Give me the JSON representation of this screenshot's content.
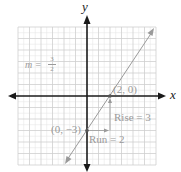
{
  "graph": {
    "axes": {
      "x_label": "x",
      "y_label": "y"
    },
    "grid": {
      "min": -6,
      "max": 6,
      "major_step": 1,
      "minor_step": 0.5
    },
    "line": {
      "slope": "3/2",
      "y_intercept": -3,
      "equation_label_lhs": "m =",
      "equation_numerator": "3",
      "equation_denominator": "2"
    },
    "points": [
      {
        "label": "(2, 0)",
        "x": 2,
        "y": 0
      },
      {
        "label": "(0, −3)",
        "x": 0,
        "y": -3
      }
    ],
    "annotations": {
      "rise": "Rise = 3",
      "run": "Run = 2"
    },
    "colors": {
      "axis": "#1a1a1a",
      "grid_major": "#cfcfcf",
      "grid_minor": "#e6e6e6",
      "line": "#9a9a9a",
      "text": "#9a9a9a"
    }
  }
}
